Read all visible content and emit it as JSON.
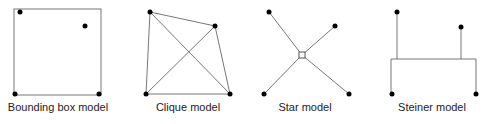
{
  "figure": {
    "panels": [
      {
        "id": "bounding-box",
        "label": "Bounding box model",
        "pins": [
          [
            20,
            12
          ],
          [
            85,
            26
          ],
          [
            15,
            94
          ],
          [
            99,
            94
          ]
        ],
        "box": {
          "x": 14,
          "y": 9,
          "w": 87,
          "h": 86
        }
      },
      {
        "id": "clique",
        "label": "Clique model",
        "pins": [
          [
            150,
            12
          ],
          [
            215,
            26
          ],
          [
            146,
            94
          ],
          [
            230,
            94
          ]
        ]
      },
      {
        "id": "star",
        "label": "Star model",
        "pins": [
          [
            269,
            12
          ],
          [
            335,
            26
          ],
          [
            264,
            94
          ],
          [
            349,
            94
          ]
        ],
        "center": [
          302,
          55
        ]
      },
      {
        "id": "steiner",
        "label": "Steiner model",
        "pins": [
          [
            397,
            12
          ],
          [
            461,
            27
          ],
          [
            392,
            94
          ],
          [
            476,
            94
          ]
        ],
        "trunk_y": 59,
        "trunk_x": [
          391,
          476
        ]
      }
    ],
    "colors": {
      "line": "#777777",
      "pin": "#000000",
      "center_fill": "#ffffff"
    }
  }
}
